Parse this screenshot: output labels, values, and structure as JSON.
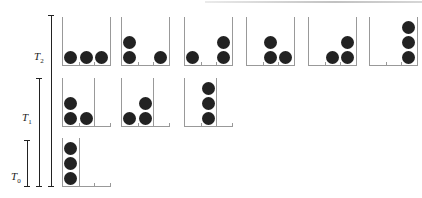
{
  "diagram": {
    "title_fragment": "",
    "levels": [
      {
        "id": "T2",
        "label": "T",
        "subscript": "2"
      },
      {
        "id": "T1",
        "label": "T",
        "subscript": "1"
      },
      {
        "id": "T0",
        "label": "T",
        "subscript": "0"
      }
    ],
    "rows": [
      {
        "level": "T2",
        "cells": [
          [
            1,
            1,
            1
          ],
          [
            2,
            0,
            1
          ],
          [
            1,
            0,
            2
          ],
          [
            0,
            2,
            1
          ],
          [
            0,
            1,
            2
          ],
          [
            0,
            0,
            3
          ]
        ]
      },
      {
        "level": "T1",
        "cells": [
          [
            2,
            1,
            0
          ],
          [
            1,
            2,
            0
          ],
          [
            0,
            3,
            0
          ]
        ]
      },
      {
        "level": "T0",
        "cells": [
          [
            3,
            0,
            0
          ]
        ]
      }
    ],
    "colors": {
      "ball": "#222222",
      "box": "#999999",
      "bracket": "#222222"
    }
  }
}
